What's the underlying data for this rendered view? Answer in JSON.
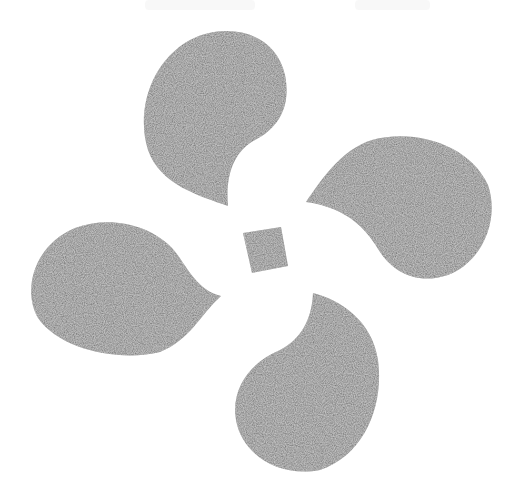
{
  "image": {
    "description": "Stamped/printed motif of four gray paisley teardrop shapes arranged in a pinwheel around a small central square",
    "background_color": "#ffffff",
    "ink_color": "#6e6e6e",
    "ink_light_color": "#8a8a8a"
  },
  "motif": {
    "shapes": [
      {
        "name": "paisley-top",
        "position": "top",
        "tail_direction": "down"
      },
      {
        "name": "paisley-right",
        "position": "right",
        "tail_direction": "left"
      },
      {
        "name": "paisley-bottom",
        "position": "bottom",
        "tail_direction": "up"
      },
      {
        "name": "paisley-left",
        "position": "left",
        "tail_direction": "right"
      },
      {
        "name": "center-square",
        "position": "center"
      }
    ]
  }
}
